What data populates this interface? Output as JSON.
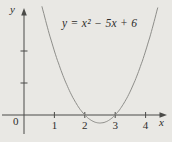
{
  "chart_data": {
    "type": "line",
    "title": "y = x² − 5x + 6",
    "equation_text": "y = x² − 5x + 6",
    "function": {
      "form": "quadratic",
      "a": 1,
      "b": -5,
      "c": 6
    },
    "key_points": [
      {
        "x": 1,
        "y": 2
      },
      {
        "x": 2,
        "y": 0
      },
      {
        "x": 2.5,
        "y": -0.25
      },
      {
        "x": 3,
        "y": 0
      },
      {
        "x": 4,
        "y": 2
      }
    ],
    "roots": [
      2,
      3
    ],
    "vertex": {
      "x": 2.5,
      "y": -0.25
    },
    "x_domain_visible": [
      0.59,
      4.41
    ],
    "x_axis_label": "x",
    "y_axis_label": "y",
    "origin_label": "0",
    "x_ticks": [
      {
        "value": 1,
        "label": "1"
      },
      {
        "value": 2,
        "label": "2"
      },
      {
        "value": 3,
        "label": "3"
      },
      {
        "value": 4,
        "label": "4"
      }
    ],
    "y_ticks": [
      {
        "value": 1,
        "label": ""
      },
      {
        "value": 2,
        "label": ""
      }
    ],
    "grid": false,
    "legend": "none",
    "colors": {
      "background": "#e9e8e4",
      "axis": "#4b4b48",
      "curve": "#8e8e8a",
      "text": "#2e2e2c"
    },
    "layout_hints": {
      "origin_px": [
        24,
        115
      ],
      "x_unit_px": 30.4,
      "y_unit_px": 32,
      "x_axis_start_px": 2,
      "x_axis_end_px": 167,
      "y_axis_top_px": 8,
      "y_axis_bottom_px": 134,
      "tick_label_baseline_px": 129
    }
  }
}
